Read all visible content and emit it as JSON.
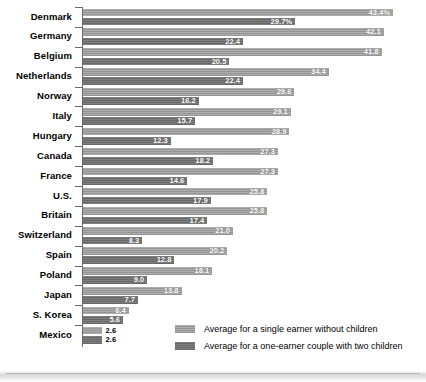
{
  "chart_data": {
    "type": "bar",
    "orientation": "horizontal",
    "title": "",
    "subtitle": "",
    "xlabel": "",
    "ylabel": "",
    "grid": false,
    "legend_position": "bottom-right",
    "xlim": [
      0,
      43.4
    ],
    "value_suffix_first_row": "%",
    "categories": [
      "Denmark",
      "Germany",
      "Belgium",
      "Netherlands",
      "Norway",
      "Italy",
      "Hungary",
      "Canada",
      "France",
      "U.S.",
      "Britain",
      "Switzerland",
      "Spain",
      "Poland",
      "Japan",
      "S. Korea",
      "Mexico"
    ],
    "series": [
      {
        "name": "Average for a single earner without children",
        "color": "#9d9d9d",
        "values": [
          43.4,
          42.1,
          41.8,
          34.4,
          29.6,
          29.1,
          28.9,
          27.3,
          27.3,
          25.8,
          25.8,
          21.0,
          20.2,
          18.1,
          13.8,
          6.4,
          2.6
        ],
        "labels": [
          "43.4%",
          "42.1",
          "41.8",
          "34.4",
          "29.6",
          "29.1",
          "28.9",
          "27.3",
          "27.3",
          "25.8",
          "25.8",
          "21.0",
          "20.2",
          "18.1",
          "13.8",
          "6.4",
          "2.6"
        ]
      },
      {
        "name": "Average for a one-earner couple with two children",
        "color": "#6d6d6d",
        "values": [
          29.7,
          22.4,
          20.5,
          22.4,
          16.2,
          15.7,
          12.3,
          18.2,
          14.6,
          17.9,
          17.4,
          8.3,
          12.8,
          9.0,
          7.7,
          5.6,
          2.6
        ],
        "labels": [
          "29.7%",
          "22.4",
          "20.5",
          "22.4",
          "16.2",
          "15.7",
          "12.3",
          "18.2",
          "14.6",
          "17.9",
          "17.4",
          "8.3",
          "12.8",
          "9.0",
          "7.7",
          "5.6",
          "2.6"
        ]
      }
    ]
  },
  "legend": {
    "items": [
      {
        "label": "Average for a single earner without children",
        "swatch": "light"
      },
      {
        "label": "Average for a one-earner couple with two children",
        "swatch": "dark"
      }
    ]
  }
}
